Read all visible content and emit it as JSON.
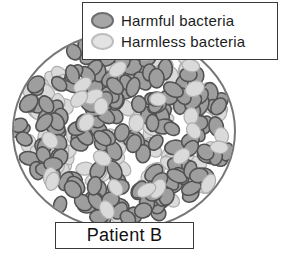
{
  "legend": {
    "items": [
      {
        "label": "Harmful bacteria",
        "swatch_fill": "#a6a6a6",
        "swatch_stroke": "#6e6e6e"
      },
      {
        "label": "Harmless bacteria",
        "swatch_fill": "#e3e3e3",
        "swatch_stroke": "#bdbdbd"
      }
    ]
  },
  "dish_label": "Patient B",
  "dish": {
    "fill": "#ffffff",
    "outline": "#767676",
    "harmful": {
      "fill": "#9e9e9e",
      "stroke": "#525252",
      "count": 185
    },
    "harmless": {
      "fill": "#dadada",
      "stroke": "#aeaeae",
      "count": 130
    }
  }
}
